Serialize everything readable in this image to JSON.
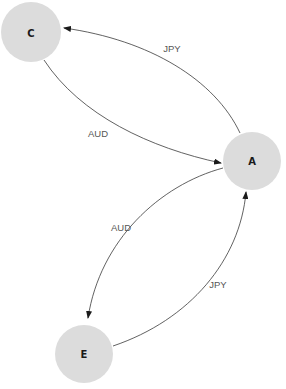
{
  "diagram": {
    "type": "directed-graph",
    "nodes": [
      {
        "id": "C",
        "label": "C"
      },
      {
        "id": "A",
        "label": "A"
      },
      {
        "id": "E",
        "label": "E"
      }
    ],
    "edges": [
      {
        "from": "A",
        "to": "C",
        "label": "JPY"
      },
      {
        "from": "C",
        "to": "A",
        "label": "AUD"
      },
      {
        "from": "A",
        "to": "E",
        "label": "AUD"
      },
      {
        "from": "E",
        "to": "A",
        "label": "JPY"
      }
    ],
    "colors": {
      "node_fill": "#dcdcdc",
      "edge_stroke": "#3a3a3a",
      "edge_label": "#555555",
      "node_label": "#1a1a1a"
    }
  }
}
